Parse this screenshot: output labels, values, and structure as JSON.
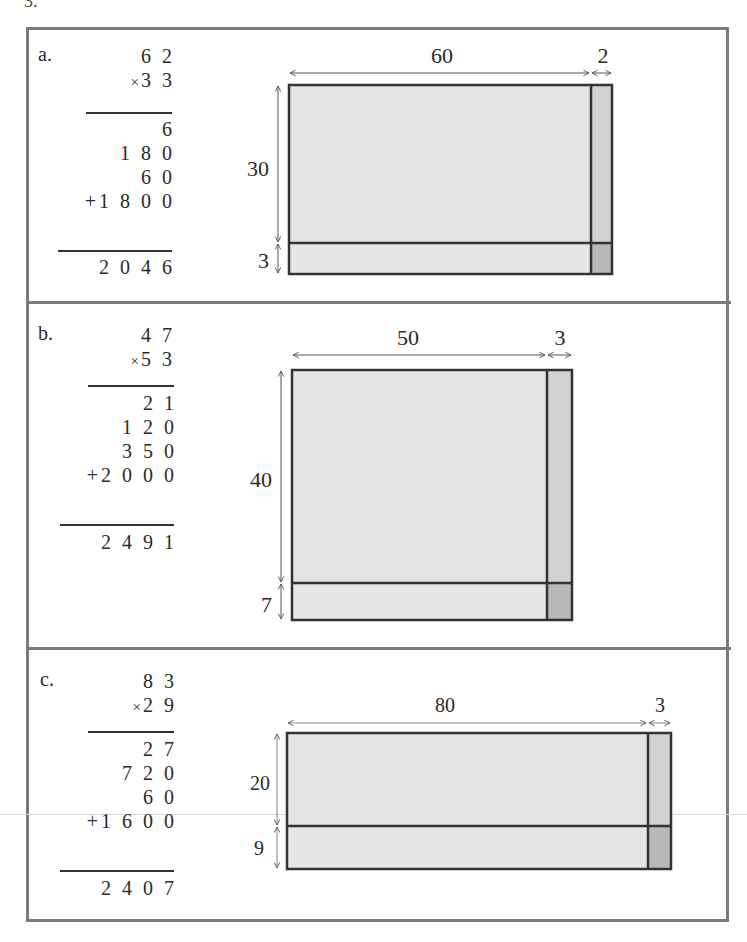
{
  "problem_number": "3.",
  "colors": {
    "frame": "#7a7a7a",
    "large_region": "#e4e4e4",
    "strip_region": "#d2d2d2",
    "corner_region": "#b8b8b8",
    "outline": "#333333",
    "arrow": "#555555"
  },
  "panels": [
    {
      "label": "a.",
      "multiplicand": "6 2",
      "multiplier": "3 3",
      "times_sign": "×",
      "partial_products": [
        "6",
        "1 8 0",
        "6 0"
      ],
      "last_partial_sign": "+",
      "last_partial": "1 8 0 0",
      "result": "2 0 4 6",
      "area_model": {
        "width_tens": "60",
        "width_ones": "2",
        "height_tens": "30",
        "height_ones": "3"
      }
    },
    {
      "label": "b.",
      "multiplicand": "4 7",
      "multiplier": "5 3",
      "times_sign": "×",
      "partial_products": [
        "2 1",
        "1 2 0",
        "3 5 0"
      ],
      "last_partial_sign": "+",
      "last_partial": "2 0 0 0",
      "result": "2 4 9 1",
      "area_model": {
        "width_tens": "50",
        "width_ones": "3",
        "height_tens": "40",
        "height_ones": "7"
      }
    },
    {
      "label": "c.",
      "multiplicand": "8 3",
      "multiplier": "2 9",
      "times_sign": "×",
      "partial_products": [
        "2 7",
        "7 2 0",
        "6 0"
      ],
      "last_partial_sign": "+",
      "last_partial": "1 6 0 0",
      "result": "2 4 0 7",
      "area_model": {
        "width_tens": "80",
        "width_ones": "3",
        "height_tens": "20",
        "height_ones": "9"
      }
    }
  ]
}
